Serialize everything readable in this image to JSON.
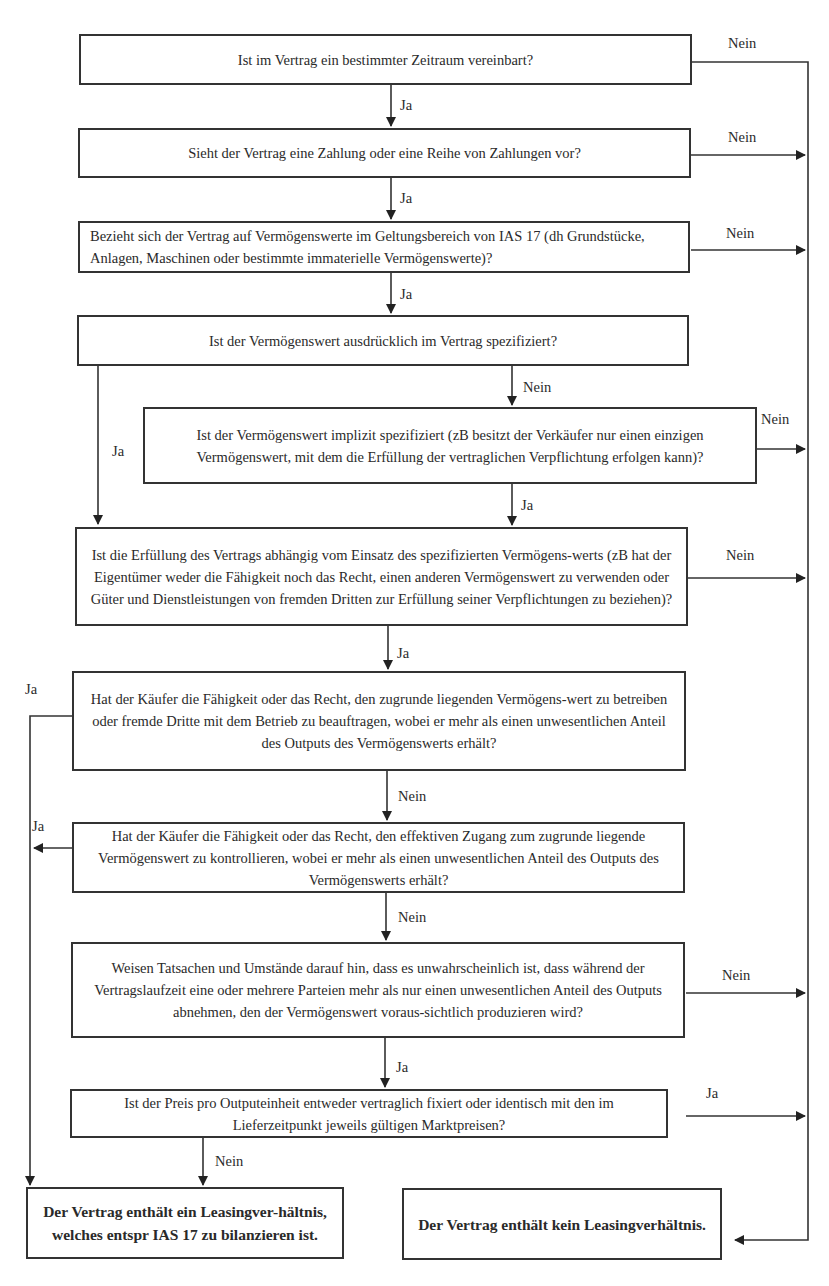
{
  "diagram": {
    "type": "flowchart",
    "nodes": [
      {
        "id": "q1",
        "text": "Ist im Vertrag ein bestimmter Zeitraum vereinbart?"
      },
      {
        "id": "q2",
        "text": "Sieht der Vertrag eine Zahlung oder eine Reihe von Zahlungen vor?"
      },
      {
        "id": "q3",
        "text": "Bezieht sich der Vertrag auf Vermögenswerte im Geltungsbereich von IAS 17 (dh Grundstücke, Anlagen, Maschinen oder bestimmte immaterielle Vermögenswerte)?"
      },
      {
        "id": "q4",
        "text": "Ist der Vermögenswert ausdrücklich im Vertrag spezifiziert?"
      },
      {
        "id": "q5",
        "text": "Ist der Vermögenswert implizit spezifiziert (zB besitzt der Verkäufer nur einen einzigen Vermögenswert, mit dem die Erfüllung der vertraglichen Verpflichtung erfolgen kann)?"
      },
      {
        "id": "q6",
        "text": "Ist die Erfüllung des Vertrags abhängig vom Einsatz des spezifizierten Vermögens-werts (zB hat der Eigentümer weder die Fähigkeit noch das Recht, einen anderen Vermögenswert zu verwenden oder Güter und Dienstleistungen von fremden Dritten zur Erfüllung seiner Verpflichtungen zu beziehen)?"
      },
      {
        "id": "q7",
        "text": "Hat der Käufer die Fähigkeit oder das Recht, den zugrunde liegenden Vermögens-wert zu betreiben oder fremde Dritte mit dem Betrieb zu beauftragen, wobei er mehr als einen unwesentlichen Anteil des Outputs des Vermögenswerts erhält?"
      },
      {
        "id": "q8",
        "text": "Hat der Käufer die Fähigkeit oder das Recht, den effektiven Zugang zum zugrunde liegende Vermögenswert zu kontrollieren, wobei er mehr als einen unwesentlichen Anteil des Outputs des Vermögenswerts erhält?"
      },
      {
        "id": "q9",
        "text": "Weisen Tatsachen und Umstände darauf hin, dass es unwahrscheinlich ist, dass während der Vertragslaufzeit eine oder mehrere Parteien mehr als nur einen unwesentlichen Anteil des Outputs abnehmen, den der Vermögenswert voraus-sichtlich produzieren wird?"
      },
      {
        "id": "q10",
        "text": "Ist der Preis pro Outputeinheit entweder vertraglich fixiert oder identisch mit den im Lieferzeitpunkt jeweils gültigen Marktpreisen?"
      },
      {
        "id": "r_yes",
        "text": "Der Vertrag enthält ein Leasingver-hältnis, welches entspr IAS 17 zu bilanzieren ist."
      },
      {
        "id": "r_no",
        "text": "Der Vertrag enthält kein Leasingverhältnis."
      }
    ],
    "labels": {
      "yes": "Ja",
      "no": "Nein"
    },
    "edges": [
      {
        "from": "q1",
        "to": "q2",
        "label": "Ja"
      },
      {
        "from": "q1",
        "to": "r_no",
        "label": "Nein"
      },
      {
        "from": "q2",
        "to": "q3",
        "label": "Ja"
      },
      {
        "from": "q2",
        "to": "r_no",
        "label": "Nein"
      },
      {
        "from": "q3",
        "to": "q4",
        "label": "Ja"
      },
      {
        "from": "q3",
        "to": "r_no",
        "label": "Nein"
      },
      {
        "from": "q4",
        "to": "q6",
        "label": "Ja"
      },
      {
        "from": "q4",
        "to": "q5",
        "label": "Nein"
      },
      {
        "from": "q5",
        "to": "q6",
        "label": "Ja"
      },
      {
        "from": "q5",
        "to": "r_no",
        "label": "Nein"
      },
      {
        "from": "q6",
        "to": "q7",
        "label": "Ja"
      },
      {
        "from": "q6",
        "to": "r_no",
        "label": "Nein"
      },
      {
        "from": "q7",
        "to": "r_yes",
        "label": "Ja"
      },
      {
        "from": "q7",
        "to": "q8",
        "label": "Nein"
      },
      {
        "from": "q8",
        "to": "r_yes",
        "label": "Ja"
      },
      {
        "from": "q8",
        "to": "q9",
        "label": "Nein"
      },
      {
        "from": "q9",
        "to": "q10",
        "label": "Ja"
      },
      {
        "from": "q9",
        "to": "r_no",
        "label": "Nein"
      },
      {
        "from": "q10",
        "to": "r_no",
        "label": "Ja"
      },
      {
        "from": "q10",
        "to": "r_yes",
        "label": "Nein"
      }
    ]
  }
}
